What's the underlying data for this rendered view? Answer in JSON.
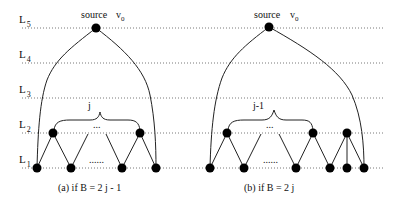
{
  "levels": [
    {
      "name": "L",
      "sub": "5",
      "y": 28
    },
    {
      "name": "L",
      "sub": "4",
      "y": 63
    },
    {
      "name": "L",
      "sub": "3",
      "y": 98
    },
    {
      "name": "L",
      "sub": "2",
      "y": 133
    },
    {
      "name": "L",
      "sub": "1",
      "y": 168
    }
  ],
  "panel_a": {
    "source_label": "source",
    "source_var": "v",
    "source_var_sub": "0",
    "brace_label": "j",
    "ellipsis_top": "...",
    "ellipsis_bottom": "......",
    "caption": "(a) if B = 2 j - 1"
  },
  "panel_b": {
    "source_label": "source",
    "source_var": "v",
    "source_var_sub": "0",
    "brace_label": "j-1",
    "ellipsis_top": "...",
    "ellipsis_bottom": "......",
    "caption": "(b) if B = 2 j"
  }
}
